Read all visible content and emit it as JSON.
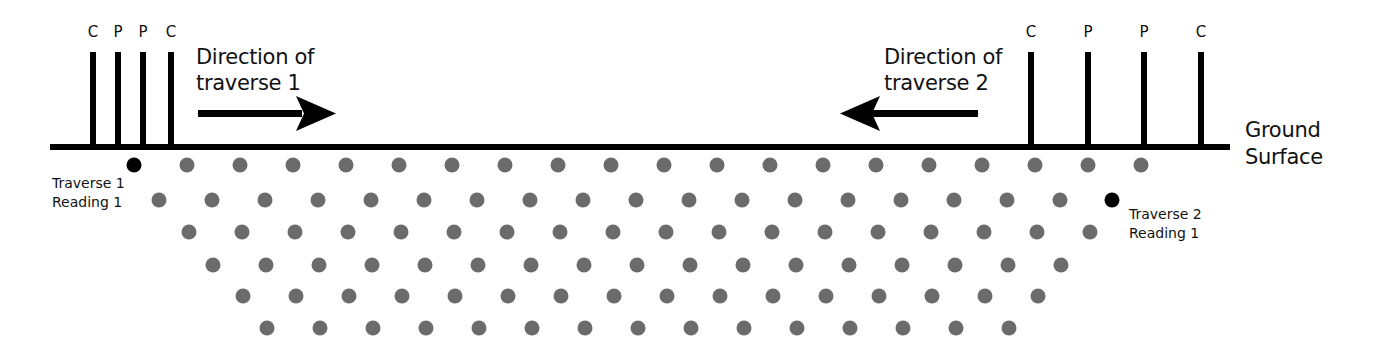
{
  "diagram": {
    "colors": {
      "line": "#000000",
      "dot": "#6b6b6b",
      "reading_dot": "#000000",
      "background": "#ffffff",
      "text": "#111111"
    },
    "ground": {
      "label_line1": "Ground",
      "label_line2": "Surface",
      "y": 147,
      "x1": 50,
      "x2": 1230
    },
    "traverse1": {
      "direction_line1": "Direction of",
      "direction_line2": "traverse 1",
      "arrow": "right",
      "electrodes": [
        {
          "label": "C",
          "x": 93
        },
        {
          "label": "P",
          "x": 118
        },
        {
          "label": "P",
          "x": 143
        },
        {
          "label": "C",
          "x": 171
        }
      ],
      "reading_label_line1": "Traverse 1",
      "reading_label_line2": "Reading 1",
      "reading_point": {
        "x": 134,
        "y": 165
      }
    },
    "traverse2": {
      "direction_line1": "Direction of",
      "direction_line2": "traverse 2",
      "arrow": "left",
      "electrodes": [
        {
          "label": "C",
          "x": 1031
        },
        {
          "label": "P",
          "x": 1088
        },
        {
          "label": "P",
          "x": 1144
        },
        {
          "label": "C",
          "x": 1201
        }
      ],
      "reading_label_line1": "Traverse 2",
      "reading_label_line2": "Reading 1",
      "reading_point": {
        "x": 1112,
        "y": 200
      }
    },
    "pseudosection_rows": [
      {
        "y": 165,
        "x_start": 187,
        "x_end": 1141,
        "spacing": 53
      },
      {
        "y": 200,
        "x_start": 159,
        "x_end": 1060,
        "spacing": 53
      },
      {
        "y": 232,
        "x_start": 189,
        "x_end": 1090,
        "spacing": 53
      },
      {
        "y": 265,
        "x_start": 213,
        "x_end": 1061,
        "spacing": 53
      },
      {
        "y": 296,
        "x_start": 243,
        "x_end": 1038,
        "spacing": 53
      },
      {
        "y": 328,
        "x_start": 267,
        "x_end": 1009,
        "spacing": 53
      }
    ]
  }
}
